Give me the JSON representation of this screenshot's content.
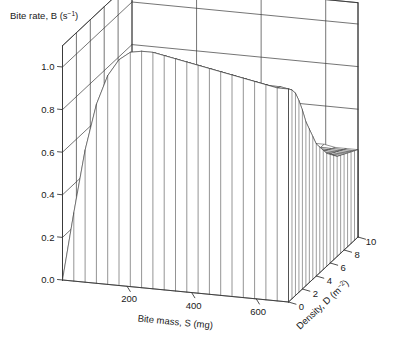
{
  "figure": {
    "background_color": "#ffffff",
    "line_color": "#3a3a3a",
    "text_color": "#1a1a1a"
  },
  "labels": {
    "z_axis_title_main": "Bite rate, B (s",
    "z_axis_title_sup": "−1",
    "z_axis_title_tail": ")",
    "x_axis_title": "Bite mass, S (mg)",
    "y_axis_title_main": "Density, D (m",
    "y_axis_title_sup": "−2",
    "y_axis_title_tail": ")"
  },
  "ticks": {
    "z": [
      "1.0",
      "0.8",
      "0.6",
      "0.4",
      "0.2",
      "0.0"
    ],
    "x": [
      "200",
      "400",
      "600"
    ],
    "y": [
      "0",
      "2",
      "4",
      "6",
      "8",
      "10"
    ]
  },
  "chart_data": {
    "type": "surface",
    "title": "Bite rate, B (s−1)",
    "xlabel": "Bite mass, S (mg)",
    "ylabel": "Density, D (m−2)",
    "zlabel": "Bite rate, B (s−1)",
    "xlim": [
      0,
      700
    ],
    "ylim": [
      0,
      10
    ],
    "zlim": [
      0.0,
      1.1
    ],
    "xticks": [
      200,
      400,
      600
    ],
    "yticks": [
      0,
      2,
      4,
      6,
      8,
      10
    ],
    "zticks": [
      0.0,
      0.2,
      0.4,
      0.6,
      0.8,
      1.0
    ],
    "grid": true,
    "legend": "none",
    "x": [
      0,
      35,
      70,
      105,
      140,
      175,
      210,
      245,
      280,
      315,
      350,
      385,
      420,
      455,
      490,
      525,
      560,
      595,
      630,
      665,
      700
    ],
    "y": [
      0,
      0.5,
      1,
      1.5,
      2,
      2.5,
      3,
      3.5,
      4,
      4.5,
      5,
      5.5,
      6,
      6.5,
      7,
      7.5,
      8,
      8.5,
      9,
      9.5,
      10
    ],
    "z_note": "Bite rate B as a joint function of bite mass S and sward density D; B rises steeply with S to a ridge near S=300 mg at low density, then falls away as density D increases, flattening to a plateau near B=0.42 at high D.",
    "surface_rows": [
      {
        "D": 0,
        "B": [
          0.0,
          0.32,
          0.62,
          0.84,
          0.98,
          1.06,
          1.1,
          1.11,
          1.11,
          1.1,
          1.09,
          1.08,
          1.07,
          1.06,
          1.05,
          1.04,
          1.03,
          1.02,
          1.01,
          1.0,
          1.0
        ]
      },
      {
        "D": 0.5,
        "B": [
          0.0,
          0.31,
          0.6,
          0.82,
          0.96,
          1.04,
          1.08,
          1.09,
          1.09,
          1.08,
          1.07,
          1.06,
          1.05,
          1.04,
          1.03,
          1.02,
          1.01,
          1.0,
          0.99,
          0.99,
          0.98
        ]
      },
      {
        "D": 1,
        "B": [
          0.0,
          0.3,
          0.58,
          0.79,
          0.93,
          1.01,
          1.05,
          1.06,
          1.06,
          1.05,
          1.04,
          1.03,
          1.02,
          1.01,
          1.0,
          0.99,
          0.98,
          0.97,
          0.96,
          0.96,
          0.95
        ]
      },
      {
        "D": 1.5,
        "B": [
          0.0,
          0.29,
          0.55,
          0.75,
          0.88,
          0.96,
          0.99,
          1.0,
          1.0,
          0.99,
          0.98,
          0.97,
          0.96,
          0.95,
          0.94,
          0.93,
          0.92,
          0.91,
          0.91,
          0.9,
          0.9
        ]
      },
      {
        "D": 2,
        "B": [
          0.0,
          0.28,
          0.52,
          0.7,
          0.82,
          0.89,
          0.92,
          0.93,
          0.93,
          0.92,
          0.91,
          0.9,
          0.89,
          0.88,
          0.87,
          0.86,
          0.86,
          0.85,
          0.85,
          0.84,
          0.84
        ]
      },
      {
        "D": 2.5,
        "B": [
          0.0,
          0.27,
          0.49,
          0.65,
          0.76,
          0.82,
          0.85,
          0.86,
          0.85,
          0.84,
          0.83,
          0.82,
          0.81,
          0.81,
          0.8,
          0.79,
          0.79,
          0.78,
          0.78,
          0.78,
          0.77
        ]
      },
      {
        "D": 3,
        "B": [
          0.0,
          0.26,
          0.46,
          0.61,
          0.7,
          0.75,
          0.78,
          0.78,
          0.78,
          0.77,
          0.76,
          0.75,
          0.75,
          0.74,
          0.74,
          0.73,
          0.73,
          0.72,
          0.72,
          0.72,
          0.72
        ]
      },
      {
        "D": 3.5,
        "B": [
          0.0,
          0.25,
          0.43,
          0.56,
          0.64,
          0.69,
          0.71,
          0.72,
          0.71,
          0.71,
          0.7,
          0.69,
          0.69,
          0.68,
          0.68,
          0.68,
          0.67,
          0.67,
          0.67,
          0.67,
          0.67
        ]
      },
      {
        "D": 4,
        "B": [
          0.0,
          0.24,
          0.41,
          0.53,
          0.6,
          0.64,
          0.66,
          0.66,
          0.66,
          0.65,
          0.65,
          0.64,
          0.64,
          0.64,
          0.63,
          0.63,
          0.63,
          0.63,
          0.62,
          0.62,
          0.62
        ]
      },
      {
        "D": 4.5,
        "B": [
          0.0,
          0.23,
          0.39,
          0.5,
          0.56,
          0.6,
          0.61,
          0.62,
          0.61,
          0.61,
          0.61,
          0.6,
          0.6,
          0.6,
          0.6,
          0.59,
          0.59,
          0.59,
          0.59,
          0.59,
          0.59
        ]
      },
      {
        "D": 5,
        "B": [
          0.0,
          0.22,
          0.37,
          0.47,
          0.53,
          0.56,
          0.57,
          0.58,
          0.58,
          0.57,
          0.57,
          0.57,
          0.57,
          0.56,
          0.56,
          0.56,
          0.56,
          0.56,
          0.56,
          0.56,
          0.56
        ]
      },
      {
        "D": 5.5,
        "B": [
          0.0,
          0.21,
          0.35,
          0.45,
          0.5,
          0.53,
          0.54,
          0.55,
          0.55,
          0.54,
          0.54,
          0.54,
          0.54,
          0.54,
          0.54,
          0.53,
          0.53,
          0.53,
          0.53,
          0.53,
          0.53
        ]
      },
      {
        "D": 6,
        "B": [
          0.0,
          0.21,
          0.34,
          0.43,
          0.48,
          0.5,
          0.52,
          0.52,
          0.52,
          0.52,
          0.52,
          0.51,
          0.51,
          0.51,
          0.51,
          0.51,
          0.51,
          0.51,
          0.51,
          0.51,
          0.51
        ]
      },
      {
        "D": 6.5,
        "B": [
          0.0,
          0.2,
          0.33,
          0.41,
          0.46,
          0.48,
          0.49,
          0.5,
          0.5,
          0.5,
          0.5,
          0.49,
          0.49,
          0.49,
          0.49,
          0.49,
          0.49,
          0.49,
          0.49,
          0.49,
          0.49
        ]
      },
      {
        "D": 7,
        "B": [
          0.0,
          0.2,
          0.32,
          0.4,
          0.44,
          0.46,
          0.48,
          0.48,
          0.48,
          0.48,
          0.48,
          0.48,
          0.48,
          0.48,
          0.47,
          0.47,
          0.47,
          0.47,
          0.47,
          0.47,
          0.47
        ]
      },
      {
        "D": 7.5,
        "B": [
          0.0,
          0.19,
          0.31,
          0.39,
          0.43,
          0.45,
          0.46,
          0.47,
          0.47,
          0.47,
          0.46,
          0.46,
          0.46,
          0.46,
          0.46,
          0.46,
          0.46,
          0.46,
          0.46,
          0.46,
          0.46
        ]
      },
      {
        "D": 8,
        "B": [
          0.0,
          0.19,
          0.3,
          0.38,
          0.42,
          0.44,
          0.45,
          0.45,
          0.45,
          0.45,
          0.45,
          0.45,
          0.45,
          0.45,
          0.45,
          0.45,
          0.45,
          0.45,
          0.45,
          0.45,
          0.45
        ]
      },
      {
        "D": 8.5,
        "B": [
          0.0,
          0.19,
          0.3,
          0.37,
          0.41,
          0.43,
          0.44,
          0.44,
          0.44,
          0.44,
          0.44,
          0.44,
          0.44,
          0.44,
          0.44,
          0.44,
          0.44,
          0.44,
          0.44,
          0.44,
          0.44
        ]
      },
      {
        "D": 9,
        "B": [
          0.0,
          0.18,
          0.29,
          0.36,
          0.4,
          0.42,
          0.43,
          0.43,
          0.43,
          0.43,
          0.43,
          0.43,
          0.43,
          0.43,
          0.43,
          0.43,
          0.43,
          0.43,
          0.43,
          0.43,
          0.43
        ]
      },
      {
        "D": 9.5,
        "B": [
          0.0,
          0.18,
          0.29,
          0.36,
          0.39,
          0.41,
          0.42,
          0.42,
          0.42,
          0.42,
          0.42,
          0.42,
          0.42,
          0.42,
          0.42,
          0.42,
          0.42,
          0.42,
          0.42,
          0.42,
          0.42
        ]
      },
      {
        "D": 10,
        "B": [
          0.0,
          0.18,
          0.28,
          0.35,
          0.39,
          0.41,
          0.41,
          0.42,
          0.42,
          0.42,
          0.42,
          0.42,
          0.42,
          0.42,
          0.42,
          0.42,
          0.42,
          0.42,
          0.41,
          0.41,
          0.41
        ]
      }
    ]
  }
}
